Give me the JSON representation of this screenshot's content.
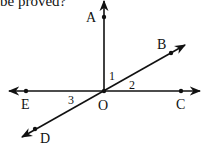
{
  "caption": "be proved?",
  "diagram": {
    "points": {
      "A": "A",
      "B": "B",
      "C": "C",
      "D": "D",
      "E": "E",
      "O": "O"
    },
    "angles": {
      "angle_1": "1",
      "angle_2": "2",
      "angle_3": "3"
    },
    "lines": [
      {
        "name": "ray OA",
        "description": "vertical ray from O upward through A"
      },
      {
        "name": "line EC",
        "description": "horizontal line through E, O, C"
      },
      {
        "name": "line DB",
        "description": "oblique line through D, O, B"
      }
    ]
  }
}
